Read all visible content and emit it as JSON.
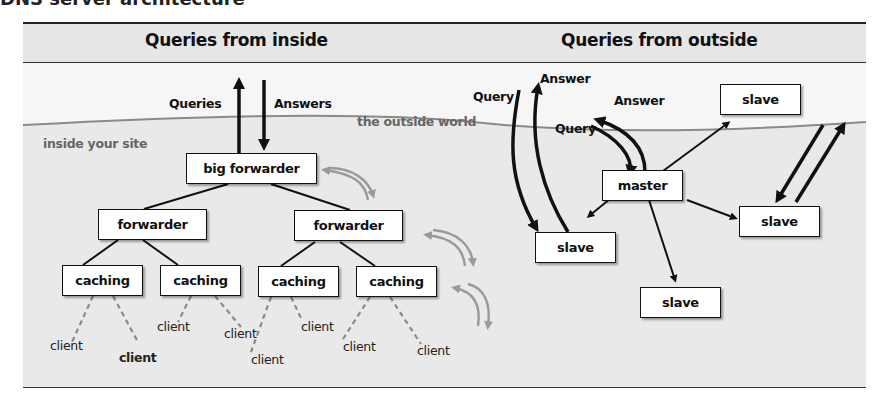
{
  "title": "DNS server architecture",
  "sections": {
    "inside": {
      "header": "Queries from inside",
      "region_labels": {
        "outside": "the outside world",
        "inside": "inside your site"
      },
      "flow_labels": {
        "queries": "Queries",
        "answers": "Answers"
      },
      "nodes": {
        "big_forwarder": "big forwarder",
        "forwarders": [
          "forwarder",
          "forwarder"
        ],
        "caching": [
          "caching",
          "caching",
          "caching",
          "caching"
        ]
      },
      "clients": [
        "client",
        "client",
        "client",
        "client",
        "client",
        "client",
        "client",
        "client"
      ]
    },
    "outside": {
      "header": "Queries from outside",
      "flow_labels": {
        "query_1": "Query",
        "answer_1": "Answer",
        "query_2": "Query",
        "answer_2": "Answer"
      },
      "nodes": {
        "master": "master",
        "slaves": [
          "slave",
          "slave",
          "slave",
          "slave"
        ]
      }
    }
  },
  "colors": {
    "outside_bg": "#f6f6f6",
    "inside_bg": "#e9e9e9",
    "header_bg": "#e6e6e6",
    "boundary_line": "#8a8a8a",
    "gray_arrow": "#9a9a9a",
    "dark": "#111111"
  }
}
